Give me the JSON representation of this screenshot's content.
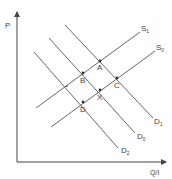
{
  "diagram": {
    "type": "supply-demand",
    "axes": {
      "y_label": "P",
      "x_label": "Q/I"
    },
    "curves": {
      "S1": {
        "base": "S",
        "sub": "1"
      },
      "S0": {
        "base": "S",
        "sub": "0"
      },
      "D1": {
        "base": "D",
        "sub": "1"
      },
      "D0": {
        "base": "D",
        "sub": "0"
      },
      "D2": {
        "base": "D",
        "sub": "2"
      }
    },
    "points": {
      "A": "A",
      "B": "B",
      "C": "C",
      "X": "X",
      "D": "D"
    },
    "colors": {
      "line": "#555555",
      "axis": "#444444",
      "point": "#333333"
    }
  }
}
